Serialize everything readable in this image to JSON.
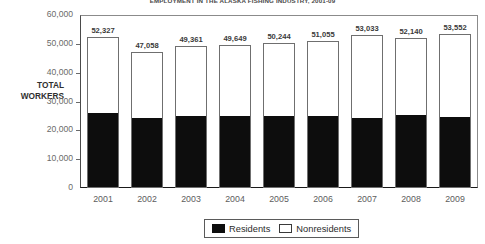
{
  "chart_data": {
    "type": "bar",
    "subtype": "stacked-vertical",
    "title": "EMPLOYMENT IN THE ALASKA FISHING INDUSTRY, 2001-09",
    "xlabel": "",
    "ylabel": "TOTAL WORKERS",
    "ylim": [
      0,
      60000
    ],
    "yticks": [
      0,
      10000,
      20000,
      30000,
      40000,
      50000,
      60000
    ],
    "ytick_labels": [
      "0",
      "10,000",
      "20,000",
      "30,000",
      "40,000",
      "50,000",
      "60,000"
    ],
    "grid": false,
    "legend_position": "bottom-center",
    "categories": [
      "2001",
      "2002",
      "2003",
      "2004",
      "2005",
      "2006",
      "2007",
      "2008",
      "2009"
    ],
    "series": [
      {
        "name": "Residents",
        "color": "#0d0d0d",
        "values": [
          25800,
          24000,
          24800,
          24800,
          24700,
          24500,
          23900,
          25000,
          24400
        ]
      },
      {
        "name": "Nonresidents",
        "color": "#ffffff",
        "values": [
          26527,
          23058,
          24561,
          24849,
          25544,
          26555,
          29133,
          27140,
          29152
        ]
      }
    ],
    "totals": [
      52327,
      47058,
      49361,
      49649,
      50244,
      51055,
      53033,
      52140,
      53552
    ],
    "total_labels": [
      "52,327",
      "47,058",
      "49,361",
      "49,649",
      "50,244",
      "51,055",
      "53,033",
      "52,140",
      "53,552"
    ]
  },
  "legend": {
    "items": [
      {
        "label": "Residents",
        "swatch": "filled-black-square"
      },
      {
        "label": "Nonresidents",
        "swatch": "outlined-white-square"
      }
    ]
  }
}
